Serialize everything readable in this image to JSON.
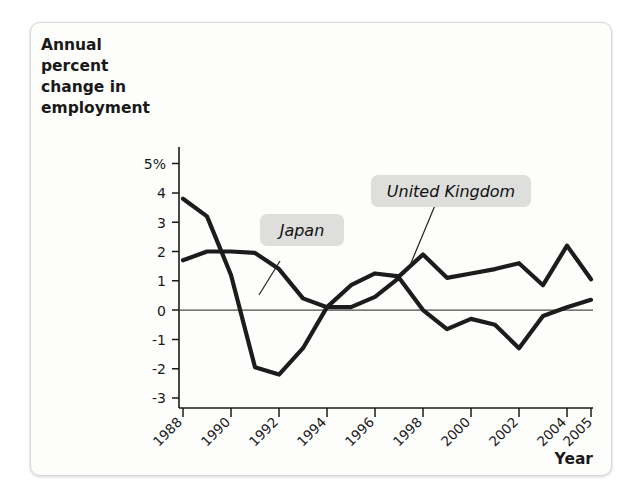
{
  "figure": {
    "background_color": "#fdfdfb",
    "border_color": "#d8d8d4"
  },
  "chart_data": {
    "type": "line",
    "title": "",
    "ylabel": "Annual percent change in employment",
    "xlabel": "Year",
    "x": [
      1988,
      1989,
      1990,
      1991,
      1992,
      1993,
      1994,
      1995,
      1996,
      1997,
      1998,
      1999,
      2000,
      2001,
      2002,
      2003,
      2004,
      2005
    ],
    "categories": [
      "1988",
      "1989",
      "1990",
      "1991",
      "1992",
      "1993",
      "1994",
      "1995",
      "1996",
      "1997",
      "1998",
      "1999",
      "2000",
      "2001",
      "2002",
      "2003",
      "2004",
      "2005"
    ],
    "xtick_labels": [
      "1988",
      "1990",
      "1992",
      "1994",
      "1996",
      "1998",
      "2000",
      "2002",
      "2004",
      "2005"
    ],
    "xtick_values": [
      1988,
      1990,
      1992,
      1994,
      1996,
      1998,
      2000,
      2002,
      2004,
      2005
    ],
    "ytick_labels": [
      "5%",
      "4",
      "3",
      "2",
      "1",
      "0",
      "-1",
      "-2",
      "-3"
    ],
    "ytick_values": [
      5,
      4,
      3,
      2,
      1,
      0,
      -1,
      -2,
      -3
    ],
    "ylim": [
      -3,
      5
    ],
    "xlim": [
      1988,
      2005
    ],
    "grid": false,
    "legend_position": "inline-annotations",
    "zero_line": true,
    "series": [
      {
        "name": "Japan",
        "color": "#1c1c1c",
        "values": [
          1.7,
          2.0,
          2.0,
          1.95,
          1.4,
          0.4,
          0.1,
          0.1,
          0.45,
          1.1,
          0.0,
          -0.65,
          -0.3,
          -0.5,
          -1.3,
          -0.2,
          0.1,
          0.35
        ]
      },
      {
        "name": "United Kingdom",
        "color": "#1c1c1c",
        "values": [
          3.8,
          3.2,
          1.2,
          -1.95,
          -2.2,
          -1.3,
          0.1,
          0.85,
          1.25,
          1.15,
          1.9,
          1.1,
          1.25,
          1.4,
          1.6,
          0.85,
          2.2,
          1.05
        ]
      }
    ],
    "annotations": [
      {
        "text": "Japan",
        "kind": "series-callout"
      },
      {
        "text": "United Kingdom",
        "kind": "series-callout"
      }
    ]
  },
  "axes": {
    "y_axis_title_lines": [
      "Annual",
      "percent",
      "change in",
      "employment"
    ],
    "x_axis_title": "Year"
  }
}
